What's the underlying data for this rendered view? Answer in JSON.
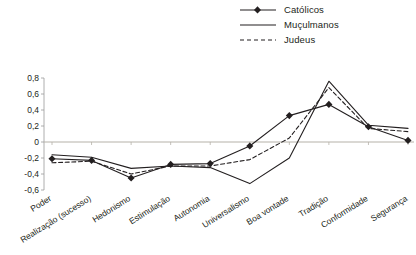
{
  "legend": {
    "position": "top-right",
    "entries": [
      {
        "label": "Católicos",
        "style": "solid-marker",
        "icon": "line-with-diamond-marker-icon"
      },
      {
        "label": "Muçulmanos",
        "style": "solid",
        "icon": "solid-line-icon"
      },
      {
        "label": "Judeus",
        "style": "dashed",
        "icon": "dashed-line-icon"
      }
    ]
  },
  "axes": {
    "y_ticks": [
      "0,8",
      "0,6",
      "0,4",
      "0,2",
      "0",
      "-0,2",
      "-0,4",
      "-0,6"
    ],
    "y_tick_values": [
      0.8,
      0.6,
      0.4,
      0.2,
      0,
      -0.2,
      -0.4,
      -0.6
    ],
    "ylim": [
      -0.6,
      0.8
    ],
    "zero_line": "0"
  },
  "colors": {
    "line": "#231f20",
    "axis": "#9a9a9a",
    "zero_axis": "#b5b1a8",
    "background": "#ffffff"
  },
  "chart_data": {
    "type": "line",
    "title": "",
    "subtitle": "",
    "xlabel": "",
    "ylabel": "",
    "ylim": [
      -0.6,
      0.8
    ],
    "grid": false,
    "legend_position": "top-right",
    "categories": [
      "Poder",
      "Realização (sucesso)",
      "Hedonismo",
      "Estimulação",
      "Autonomia",
      "Universalismo",
      "Boa vontade",
      "Tradição",
      "Conformidade",
      "Segurança"
    ],
    "series": [
      {
        "name": "Católicos",
        "style": "solid-marker",
        "values": [
          -0.21,
          -0.23,
          -0.45,
          -0.28,
          -0.27,
          -0.05,
          0.33,
          0.47,
          0.19,
          0.02
        ]
      },
      {
        "name": "Muçulmanos",
        "style": "solid",
        "values": [
          -0.16,
          -0.19,
          -0.33,
          -0.3,
          -0.32,
          -0.52,
          -0.2,
          0.76,
          0.21,
          0.17
        ]
      },
      {
        "name": "Judeus",
        "style": "dashed",
        "values": [
          -0.26,
          -0.24,
          -0.4,
          -0.3,
          -0.3,
          -0.22,
          0.05,
          0.68,
          0.17,
          0.13
        ]
      }
    ]
  }
}
